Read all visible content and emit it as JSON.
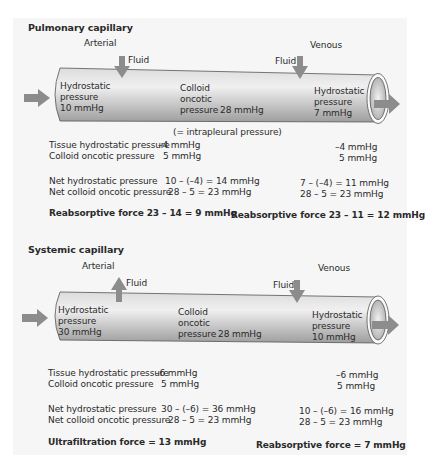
{
  "pulmonary": {
    "title": "Pulmonary capillary",
    "arterial_label": "Arterial",
    "venous_label": "Venous",
    "fluid_left": {
      "label": "Fluid",
      "direction": "into-capillary"
    },
    "fluid_right": {
      "label": "Fluid",
      "direction": "into-capillary"
    },
    "tube": {
      "left": {
        "l1": "Hydrostatic",
        "l2": "pressure",
        "l3": "10 mmHg"
      },
      "middle": {
        "l1": "Colloid",
        "l2": "oncotic",
        "l3": "pressure",
        "value": "28 mmHg"
      },
      "right": {
        "l1": "Hydrostatic",
        "l2": "pressure",
        "l3": "7 mmHg"
      }
    },
    "note": "(= intrapleural pressure)",
    "labels": {
      "tissue_hydro": "Tissue hydrostatic pressure",
      "colloid_onc": "Colloid oncotic pressure",
      "net_hydro": "Net hydrostatic pressure",
      "net_colloid": "Net colloid oncotic pressure"
    },
    "arterial": {
      "tissue_hydro": "–4 mmHg",
      "colloid_onc": "5 mmHg",
      "net_hydro": "10 – (–4) = 14 mmHg",
      "net_colloid": "28 – 5 = 23 mmHg",
      "result": "Reabsorptive force  23 – 14 = 9 mmHg"
    },
    "venous": {
      "tissue_hydro": "–4 mmHg",
      "colloid_onc": "5 mmHg",
      "net_hydro": "7 – (–4) =  11 mmHg",
      "net_colloid": "28 – 5  = 23 mmHg",
      "result": "Reabsorptive force 23 – 11 = 12 mmHg"
    }
  },
  "systemic": {
    "title": "Systemic capillary",
    "arterial_label": "Arterial",
    "venous_label": "Venous",
    "fluid_left": {
      "label": "Fluid",
      "direction": "out-of-capillary"
    },
    "fluid_right": {
      "label": "Fluid",
      "direction": "into-capillary"
    },
    "tube": {
      "left": {
        "l1": "Hydrostatic",
        "l2": "pressure",
        "l3": "30 mmHg"
      },
      "middle": {
        "l1": "Colloid",
        "l2": "oncotic",
        "l3": "pressure",
        "value": "28 mmHg"
      },
      "right": {
        "l1": "Hydrostatic",
        "l2": "pressure",
        "l3": "10 mmHg"
      }
    },
    "labels": {
      "tissue_hydro": "Tissue hydrostatic pressure",
      "colloid_onc": "Colloid oncotic pressure",
      "net_hydro": "Net hydrostatic pressure",
      "net_colloid": "Net colloid oncotic pressure"
    },
    "arterial": {
      "tissue_hydro": "–6 mmHg",
      "colloid_onc": "5 mmHg",
      "net_hydro": "30 – (–6) = 36 mmHg",
      "net_colloid": "28 – 5 = 23 mmHg",
      "result": "Ultrafiltration force = 13 mmHg"
    },
    "venous": {
      "tissue_hydro": "–6 mmHg",
      "colloid_onc": "5 mmHg",
      "net_hydro": "10 – (–6) = 16 mmHg",
      "net_colloid": "28 – 5  = 23 mmHg",
      "result": "Reabsorptive force  = 7 mmHg"
    }
  },
  "colors": {
    "panel": "#f6f6f6",
    "arrow": "#8c8c8c",
    "tube_dark": "#b4b4b4",
    "tube_light": "#ececec",
    "text": "#2a2a2a"
  }
}
